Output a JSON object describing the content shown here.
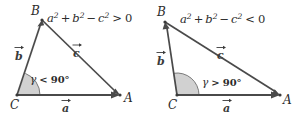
{
  "figure": {
    "background_color": "#ffffff",
    "line_color": "#4a4a4a",
    "wedge_color": "#c9c9c9",
    "text_color": "#2b2b2b"
  },
  "panels": [
    {
      "id": "acute",
      "name": "acute-triangle-panel",
      "formula": {
        "a": "a",
        "a_exp": "2",
        "plus": "+",
        "b": "b",
        "b_exp": "2",
        "minus": "−",
        "c": "c",
        "c_exp": "2",
        "relation": ">",
        "rhs": "0",
        "full": "a² + b² − c² > 0"
      },
      "vertices": [
        {
          "label": "B",
          "x": 42,
          "y": 20
        },
        {
          "label": "C",
          "x": 17,
          "y": 95
        },
        {
          "label": "A",
          "x": 120,
          "y": 95
        }
      ],
      "vectors": [
        {
          "label": "a",
          "accent": "arrow",
          "from": "C",
          "to": "A"
        },
        {
          "label": "b",
          "accent": "arrow",
          "from": "C",
          "to": "B"
        },
        {
          "label": "c",
          "accent": "arrow",
          "from": "B",
          "to": "A"
        }
      ],
      "angle": {
        "symbol": "γ",
        "relation": "<",
        "value": "90°",
        "full": "γ < 90°",
        "at_vertex": "C",
        "kind": "acute"
      }
    },
    {
      "id": "obtuse",
      "name": "obtuse-triangle-panel",
      "formula": {
        "a": "a",
        "a_exp": "2",
        "plus": "+",
        "b": "b",
        "b_exp": "2",
        "minus": "−",
        "c": "c",
        "c_exp": "2",
        "relation": "<",
        "rhs": "0",
        "full": "a² + b² − c² < 0"
      },
      "vertices": [
        {
          "label": "B",
          "x": 18,
          "y": 22
        },
        {
          "label": "C",
          "x": 30,
          "y": 95
        },
        {
          "label": "A",
          "x": 133,
          "y": 95
        }
      ],
      "vectors": [
        {
          "label": "a",
          "accent": "arrow",
          "from": "C",
          "to": "A"
        },
        {
          "label": "b",
          "accent": "arrow",
          "from": "C",
          "to": "B"
        },
        {
          "label": "c",
          "accent": "arrow",
          "from": "B",
          "to": "A"
        }
      ],
      "angle": {
        "symbol": "γ",
        "relation": ">",
        "value": "90°",
        "full": "γ > 90°",
        "at_vertex": "C",
        "kind": "obtuse"
      }
    }
  ]
}
